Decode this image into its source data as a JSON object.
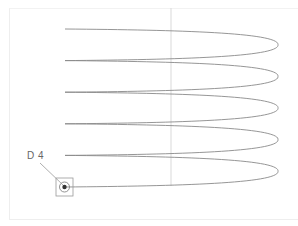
{
  "drawing": {
    "title": "Helical coil side view",
    "detail_label": "D 4",
    "colors": {
      "background": "#ffffff",
      "curve": "#8a8a8a",
      "centerline": "#d6d6d6",
      "frame": "#eeeeee",
      "label": "#666666"
    },
    "coil": {
      "turns": 5,
      "left_x": 65,
      "right_x": 278,
      "start_y": 29,
      "end_y": 187,
      "pitch": 31.6
    },
    "centerline": {
      "x": 171,
      "y1": 8,
      "y2": 186
    },
    "marker": {
      "x": 65,
      "y": 187,
      "box": 18
    }
  }
}
